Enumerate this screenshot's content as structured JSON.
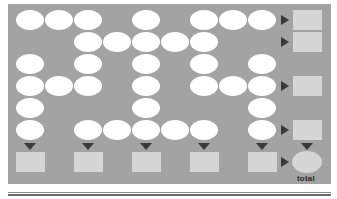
{
  "grid": {
    "columns": 9,
    "rows": 6,
    "col_centers_x": [
      30,
      59,
      88,
      117,
      146,
      175,
      204,
      233,
      262
    ],
    "row_centers_y": [
      20,
      42,
      64,
      86,
      108,
      130
    ],
    "filled": [
      [
        1,
        1,
        1,
        0,
        1,
        0,
        1,
        1,
        1
      ],
      [
        0,
        0,
        1,
        1,
        1,
        1,
        1,
        0,
        0
      ],
      [
        1,
        0,
        1,
        0,
        1,
        0,
        1,
        0,
        1
      ],
      [
        1,
        1,
        1,
        0,
        1,
        0,
        1,
        1,
        1
      ],
      [
        1,
        0,
        0,
        0,
        1,
        0,
        0,
        0,
        1
      ],
      [
        1,
        0,
        1,
        1,
        1,
        1,
        1,
        0,
        1
      ]
    ]
  },
  "row_sums": {
    "rows_with_output": [
      0,
      1,
      3,
      5
    ]
  },
  "column_sums": {
    "columns_with_output": [
      0,
      2,
      4,
      6,
      8
    ]
  },
  "total": {
    "label": "total"
  },
  "colors": {
    "panel": "#a3a3a3",
    "oval": "#ffffff",
    "box": "#d6d6d6",
    "arrow": "#3a3a3a"
  }
}
